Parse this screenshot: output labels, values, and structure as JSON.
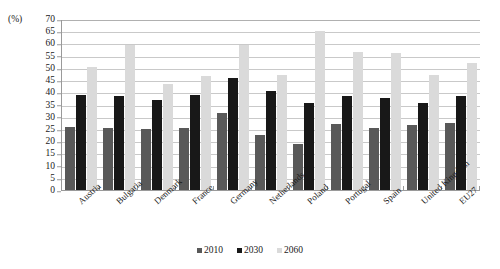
{
  "chart_data": {
    "type": "bar",
    "title": "",
    "xlabel": "",
    "ylabel": "(%)",
    "ylim": [
      0,
      70
    ],
    "ytick_step": 5,
    "yticks": [
      0,
      5,
      10,
      15,
      20,
      25,
      30,
      35,
      40,
      45,
      50,
      55,
      60,
      65,
      70
    ],
    "grid": true,
    "legend_position": "bottom",
    "categories": [
      "Austria",
      "Bulgaria",
      "Denmark",
      "France",
      "Germany",
      "Netherlands",
      "Poland",
      "Portugal",
      "Spain",
      "United Kingdom",
      "EU27"
    ],
    "series": [
      {
        "name": "2010",
        "color": "#595959",
        "values": [
          26,
          25.5,
          25,
          25.5,
          31.5,
          22.5,
          19,
          27,
          25.5,
          26.5,
          27.5
        ]
      },
      {
        "name": "2030",
        "color": "#181818",
        "values": [
          39,
          38.5,
          37,
          39,
          46,
          40.5,
          35.5,
          38.5,
          37.5,
          35.5,
          38.5
        ]
      },
      {
        "name": "2060",
        "color": "#dadada",
        "values": [
          50.5,
          59.5,
          43.5,
          46.5,
          59.5,
          47,
          65,
          56.5,
          56,
          47,
          52
        ]
      }
    ]
  }
}
